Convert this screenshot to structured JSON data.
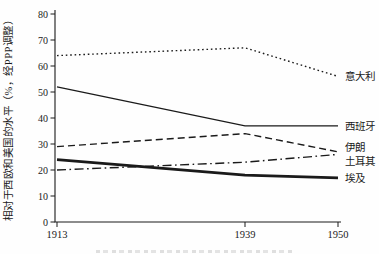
{
  "page": {
    "background_color": "#ffffff",
    "text_color": "#1a1a1a"
  },
  "chart_data": {
    "type": "line",
    "x": [
      1913,
      1939,
      1950
    ],
    "x_tick_labels": [
      "1913",
      "1939",
      "1950"
    ],
    "ylabel": "相对于西欧和美国的水平（%，经PPP调整）",
    "ylim": [
      0,
      80
    ],
    "yticks": [
      0,
      10,
      20,
      30,
      40,
      50,
      60,
      70,
      80
    ],
    "grid": false,
    "line_color": "#1a1a1a",
    "legend_position": "labels at right ends of lines",
    "series": [
      {
        "name": "italy",
        "label": "意大利",
        "style": "dotted",
        "thickness": "thin",
        "values": [
          64,
          67,
          56
        ]
      },
      {
        "name": "spain",
        "label": "西班牙",
        "style": "solid",
        "thickness": "thin",
        "values": [
          52,
          37,
          37
        ]
      },
      {
        "name": "iran",
        "label": "伊朗",
        "style": "dashed",
        "thickness": "thin",
        "values": [
          29,
          34,
          27
        ]
      },
      {
        "name": "turkey",
        "label": "土耳其",
        "style": "dashdot",
        "thickness": "thin",
        "values": [
          20,
          23,
          26
        ]
      },
      {
        "name": "egypt",
        "label": "埃及",
        "style": "solid",
        "thickness": "thick",
        "values": [
          24,
          18,
          17
        ]
      }
    ]
  }
}
